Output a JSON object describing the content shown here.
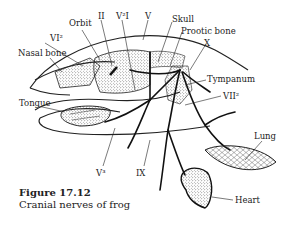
{
  "figure": {
    "number": "Figure 17.12",
    "caption": "Cranial nerves of frog"
  },
  "labels": {
    "orbit": "Orbit",
    "nerve_II": "II",
    "nerve_V2I": "V²I",
    "nerve_V": "V",
    "skull": "Skull",
    "prootic_bone": "Prootic bone",
    "nerve_X": "X",
    "nerve_VI2": "VI²",
    "nasal_bone": "Nasal bone",
    "tympanum": "Tympanum",
    "nerve_VII2": "VII²",
    "tongue": "Tongue",
    "nerve_V3": "V³",
    "nerve_IX": "IX",
    "lung": "Lung",
    "heart": "Heart"
  },
  "colors": {
    "ink": "#222222",
    "background": "#ffffff"
  }
}
